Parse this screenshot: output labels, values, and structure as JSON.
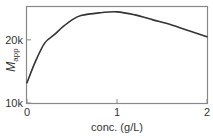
{
  "chart_data": {
    "type": "line",
    "title": "",
    "xlabel": "conc. (g/L)",
    "ylabel": "M_app",
    "ylabel_main": "M",
    "ylabel_sub": "app",
    "xlim": [
      0,
      2
    ],
    "ylim": [
      10000,
      29000
    ],
    "yscale": "log",
    "grid": false,
    "legend": null,
    "x_ticks": [
      0,
      1,
      2
    ],
    "x_tick_labels": [
      "0",
      "1",
      "2"
    ],
    "y_ticks": [
      10000,
      20000
    ],
    "y_tick_labels": [
      "10k",
      "20k"
    ],
    "series": [
      {
        "name": "M_app",
        "color": "#333333",
        "x": [
          0,
          0.1,
          0.2,
          0.3,
          0.4,
          0.5,
          0.6,
          0.8,
          1.0,
          1.2,
          1.4,
          1.6,
          1.8,
          2.0
        ],
        "y": [
          12500,
          16000,
          19400,
          21100,
          23100,
          24900,
          26100,
          26900,
          27200,
          26300,
          24900,
          23600,
          22100,
          20700
        ]
      }
    ]
  }
}
